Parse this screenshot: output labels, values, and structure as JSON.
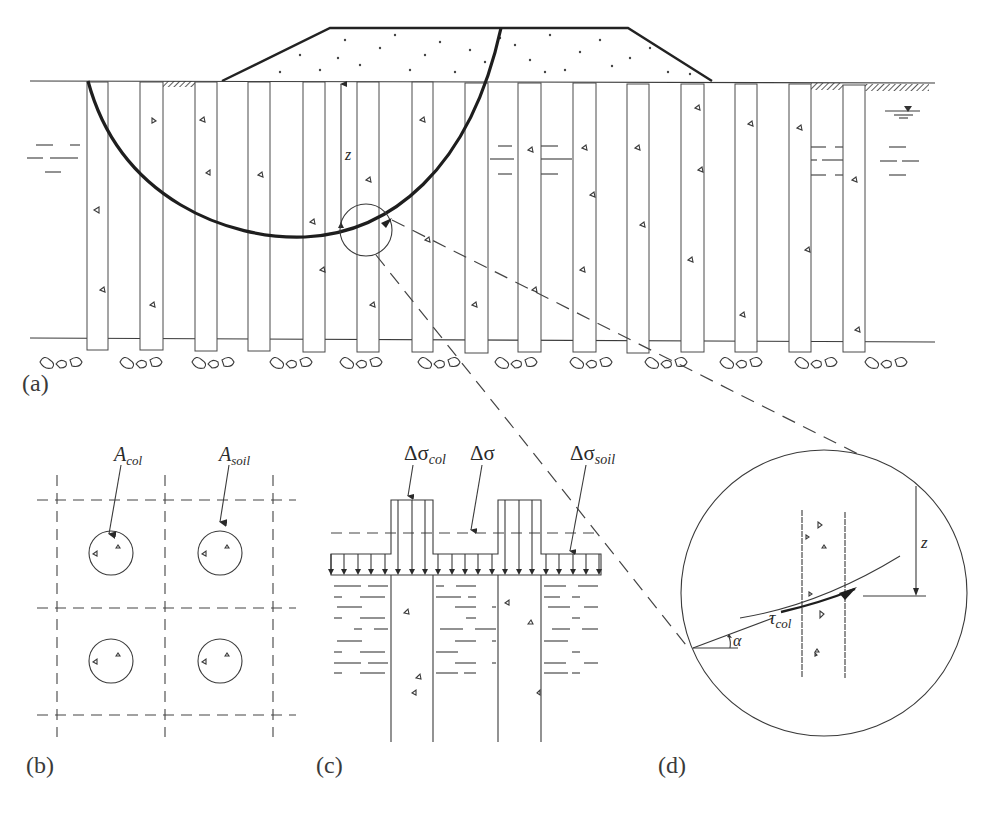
{
  "panels": {
    "a": {
      "label": "(a)",
      "depth_symbol": "z",
      "description": "Embankment on column-supported soft ground with circular slip surface"
    },
    "b": {
      "label": "(b)",
      "area_column": {
        "symbol": "A",
        "subscript": "col"
      },
      "area_soil": {
        "symbol": "A",
        "subscript": "soil"
      }
    },
    "c": {
      "label": "(c)",
      "stress_column": {
        "symbol": "Δσ",
        "subscript": "col"
      },
      "stress_average": {
        "symbol": "Δσ"
      },
      "stress_soil": {
        "symbol": "Δσ",
        "subscript": "soil"
      }
    },
    "d": {
      "label": "(d)",
      "depth_symbol": "z",
      "shear_stress": {
        "symbol": "τ",
        "subscript": "col"
      },
      "angle_symbol": "α"
    }
  },
  "colors": {
    "line": "#3a3a3a",
    "slip_surface": "#1e1e1e",
    "background": "#ffffff"
  }
}
